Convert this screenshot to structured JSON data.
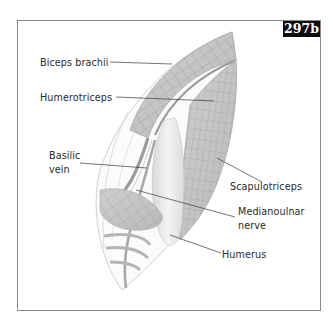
{
  "figure": {
    "id_badge": "297b",
    "labels": {
      "biceps": "Biceps brachii",
      "humerotriceps": "Humerotriceps",
      "basilic_line1": "Basilic",
      "basilic_line2": "vein",
      "scapulotriceps": "Scapulotriceps",
      "medianoulnar_line1": "Medianoulnar",
      "medianoulnar_line2": "nerve",
      "humerus": "Humerus"
    },
    "colors": {
      "muscle_fill": "#c4c4c4",
      "muscle_dark": "#9a9a9a",
      "grid_line": "#8d8d8d",
      "frame": "#8a8a8a",
      "badge_bg": "#0d0d0d",
      "badge_text": "#ffffff",
      "text": "#2a2a2a"
    }
  }
}
